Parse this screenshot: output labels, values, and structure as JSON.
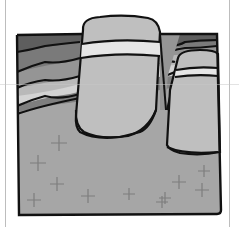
{
  "diagram": {
    "colors": {
      "background": "#ffffff",
      "outline": "#111111",
      "layer_darkest": "#5e5e5e",
      "layer_dark": "#7a7a7a",
      "layer_mid": "#959595",
      "layer_light": "#b9b9b9",
      "layer_lightest": "#d6d6d6",
      "basement": "#a6a6a6",
      "intrusion_body": "#bfbfbf",
      "intrusion_band": "#e6e6e6",
      "cross_mark": "#7d7d7d"
    },
    "elements": {
      "large_intrusion": "large cylindrical pluton",
      "small_intrusion": "small cylindrical pluton",
      "strata": "wavy sedimentary layers",
      "basement": "crystalline basement with cross symbols"
    }
  }
}
